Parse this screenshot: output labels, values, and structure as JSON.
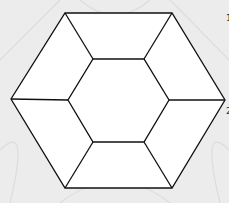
{
  "diagram": {
    "outer_hexagon": [
      [
        65,
        13
      ],
      [
        172,
        13
      ],
      [
        225,
        100
      ],
      [
        172,
        188
      ],
      [
        65,
        188
      ],
      [
        11,
        99
      ]
    ],
    "inner_hexagon": [
      [
        93,
        59
      ],
      [
        144,
        59
      ],
      [
        169,
        100
      ],
      [
        144,
        142
      ],
      [
        93,
        142
      ],
      [
        68,
        100
      ]
    ],
    "stroke_color": "#111111",
    "fill_color": "#ffffff",
    "background_color": "#ececec",
    "pattern_color": "#dcdcdc",
    "region_count": 7
  },
  "labels": {
    "top_right": "1",
    "mid_right": "2"
  }
}
